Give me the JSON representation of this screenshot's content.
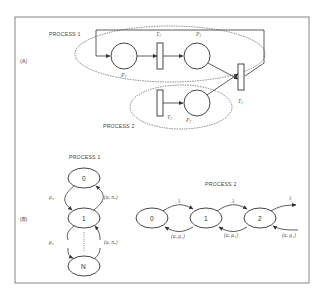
{
  "figure": {
    "panel_a": {
      "label": "(A)",
      "process1_label": "PROCESS 1",
      "process2_label": "PROCESS 2",
      "places": [
        {
          "id": "P3",
          "label": "P",
          "sub": "3"
        },
        {
          "id": "P1",
          "label": "P",
          "sub": "1"
        },
        {
          "id": "P2",
          "label": "P",
          "sub": "2"
        }
      ],
      "transitions": [
        {
          "id": "T3",
          "label": "T",
          "sub": "3"
        },
        {
          "id": "T1",
          "label": "T",
          "sub": "1"
        },
        {
          "id": "T2",
          "label": "T",
          "sub": "2"
        }
      ]
    },
    "panel_b": {
      "label": "(B)",
      "process1": {
        "title": "PROCESS 1",
        "states": [
          "0",
          "1",
          "N"
        ],
        "rate_down_1": "μ₂",
        "rate_down_2": "μ₂",
        "rate_up_1": "(a, πₐ)",
        "rate_up_2": "(a, πₐ)"
      },
      "process2": {
        "title": "PROCESS 2",
        "states": [
          "0",
          "1",
          "2"
        ],
        "arrival_rates": [
          "λ",
          "λ",
          "λ"
        ],
        "service_rates": [
          "(a, μ₁)",
          "(a, μ₁)",
          "(a, μ₁)"
        ]
      }
    }
  }
}
